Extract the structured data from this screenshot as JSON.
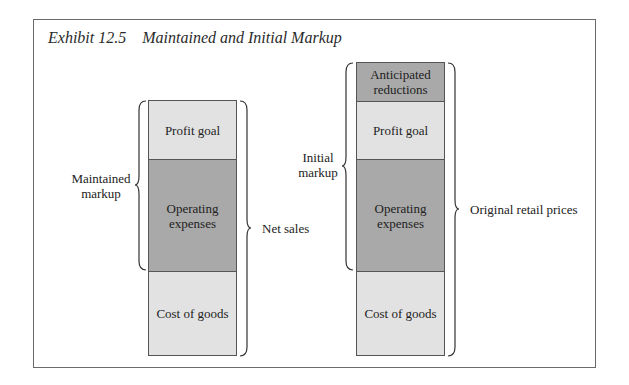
{
  "title": "Exhibit 12.5    Maintained and Initial Markup",
  "colors": {
    "light": "#e2e2e2",
    "dark": "#a9a9a9",
    "border": "#555555"
  },
  "left_column": {
    "segments": [
      {
        "label": "Profit goal",
        "shade": "light"
      },
      {
        "label": "Operating expenses",
        "shade": "dark"
      },
      {
        "label": "Cost of goods",
        "shade": "light"
      }
    ],
    "left_brace_label": "Maintained markup",
    "right_brace_label": "Net sales"
  },
  "right_column": {
    "segments": [
      {
        "label": "Anticipated reductions",
        "shade": "dark"
      },
      {
        "label": "Profit goal",
        "shade": "light"
      },
      {
        "label": "Operating expenses",
        "shade": "dark"
      },
      {
        "label": "Cost of goods",
        "shade": "light"
      }
    ],
    "left_brace_label": "Initial markup",
    "right_brace_label": "Original retail prices"
  }
}
